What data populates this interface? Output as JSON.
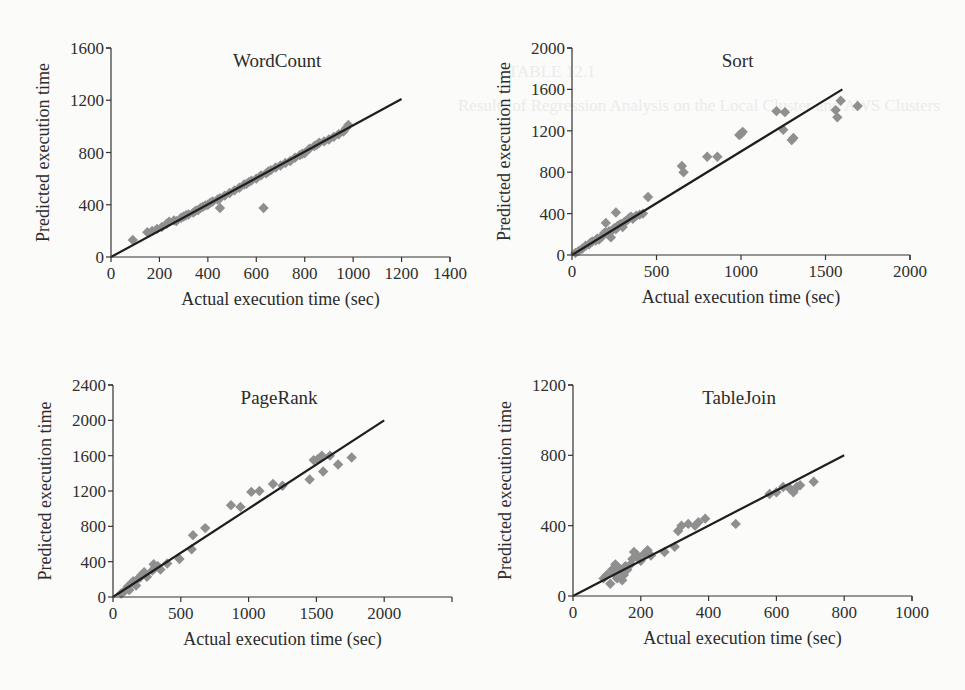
{
  "figure": {
    "background": "#fbfbfa",
    "marker_color": "#8f8f8f",
    "line_color": "#1e1e1e",
    "axis_color": "#333333"
  },
  "chart_data": [
    {
      "id": "wordcount",
      "type": "scatter",
      "title": "WordCount",
      "xlabel": "Actual execution time (sec)",
      "ylabel": "Predicted execution time",
      "xlim": [
        0,
        1400
      ],
      "ylim": [
        0,
        1600
      ],
      "xticks": [
        0,
        200,
        400,
        600,
        800,
        1000,
        1200,
        1400
      ],
      "yticks": [
        0,
        400,
        800,
        1200,
        1600
      ],
      "grid": false,
      "legend": null,
      "fit_line": {
        "x": [
          0,
          1200
        ],
        "y": [
          0,
          1210
        ]
      },
      "points": {
        "x": [
          90,
          150,
          170,
          190,
          210,
          230,
          240,
          260,
          270,
          290,
          300,
          310,
          320,
          340,
          350,
          360,
          370,
          380,
          390,
          400,
          410,
          420,
          440,
          450,
          470,
          490,
          510,
          530,
          550,
          560,
          570,
          580,
          600,
          620,
          640,
          650,
          660,
          680,
          700,
          720,
          740,
          760,
          780,
          790,
          800,
          820,
          840,
          850,
          860,
          880,
          900,
          920,
          940,
          960,
          970,
          980,
          630,
          450
        ],
        "y": [
          130,
          190,
          200,
          215,
          230,
          255,
          270,
          280,
          275,
          300,
          310,
          320,
          325,
          340,
          355,
          360,
          375,
          385,
          395,
          400,
          415,
          425,
          440,
          450,
          470,
          490,
          510,
          530,
          555,
          560,
          575,
          585,
          600,
          625,
          640,
          655,
          665,
          685,
          700,
          720,
          735,
          760,
          780,
          790,
          795,
          830,
          850,
          860,
          875,
          885,
          900,
          920,
          940,
          960,
          985,
          1010,
          375,
          375
        ]
      }
    },
    {
      "id": "sort",
      "type": "scatter",
      "title": "Sort",
      "xlabel": "Actual execution time (sec)",
      "ylabel": "Predicted execution time",
      "xlim": [
        0,
        2000
      ],
      "ylim": [
        0,
        2000
      ],
      "xticks": [
        0,
        500,
        1000,
        1500,
        2000
      ],
      "yticks": [
        0,
        400,
        800,
        1200,
        1600,
        2000
      ],
      "grid": false,
      "legend": null,
      "fit_line": {
        "x": [
          0,
          1600
        ],
        "y": [
          0,
          1600
        ]
      },
      "points": {
        "x": [
          20,
          40,
          60,
          80,
          100,
          110,
          120,
          140,
          150,
          160,
          180,
          190,
          200,
          220,
          230,
          240,
          250,
          260,
          270,
          280,
          290,
          300,
          310,
          320,
          330,
          340,
          350,
          360,
          380,
          400,
          420,
          450,
          650,
          660,
          800,
          860,
          990,
          1010,
          1000,
          1210,
          1260,
          1250,
          1300,
          1310,
          1560,
          1570,
          1590,
          1690,
          200,
          260
        ],
        "y": [
          20,
          40,
          60,
          90,
          100,
          120,
          130,
          140,
          160,
          150,
          180,
          210,
          220,
          230,
          170,
          240,
          260,
          250,
          280,
          290,
          300,
          270,
          320,
          330,
          340,
          360,
          370,
          350,
          380,
          390,
          400,
          560,
          860,
          800,
          950,
          950,
          1160,
          1190,
          1170,
          1390,
          1380,
          1210,
          1110,
          1130,
          1400,
          1330,
          1490,
          1440,
          310,
          410
        ]
      }
    },
    {
      "id": "pagerank",
      "type": "scatter",
      "title": "PageRank",
      "xlabel": "Actual execution time (sec)",
      "ylabel": "Predicted execution time",
      "xlim": [
        0,
        2500
      ],
      "ylim": [
        0,
        2400
      ],
      "xticks": [
        0,
        500,
        1000,
        1500,
        2000
      ],
      "yticks": [
        0,
        400,
        800,
        1200,
        1600,
        2000,
        2400
      ],
      "grid": false,
      "legend": null,
      "fit_line": {
        "x": [
          0,
          2000
        ],
        "y": [
          0,
          2000
        ]
      },
      "points": {
        "x": [
          60,
          80,
          100,
          110,
          120,
          140,
          150,
          170,
          180,
          200,
          210,
          230,
          250,
          290,
          300,
          310,
          330,
          350,
          400,
          490,
          580,
          590,
          680,
          870,
          940,
          1020,
          1080,
          1180,
          1250,
          1450,
          1480,
          1510,
          1540,
          1550,
          1600,
          1660,
          1760
        ],
        "y": [
          40,
          60,
          90,
          120,
          80,
          160,
          180,
          130,
          200,
          220,
          250,
          280,
          230,
          300,
          370,
          330,
          350,
          310,
          380,
          430,
          540,
          700,
          780,
          1040,
          1020,
          1190,
          1200,
          1280,
          1260,
          1330,
          1550,
          1560,
          1600,
          1420,
          1600,
          1500,
          1580
        ]
      }
    },
    {
      "id": "tablejoin",
      "type": "scatter",
      "title": "TableJoin",
      "xlabel": "Actual execution time (sec)",
      "ylabel": "Predicted execution time",
      "xlim": [
        0,
        1000
      ],
      "ylim": [
        0,
        1200
      ],
      "xticks": [
        0,
        200,
        400,
        600,
        800,
        1000
      ],
      "yticks": [
        0,
        400,
        800,
        1200
      ],
      "grid": false,
      "legend": null,
      "fit_line": {
        "x": [
          0,
          800
        ],
        "y": [
          0,
          800
        ]
      },
      "points": {
        "x": [
          90,
          100,
          110,
          115,
          120,
          125,
          130,
          135,
          140,
          145,
          150,
          155,
          160,
          170,
          175,
          180,
          190,
          200,
          210,
          220,
          230,
          270,
          300,
          310,
          320,
          340,
          360,
          370,
          390,
          480,
          580,
          600,
          620,
          640,
          650,
          660,
          670,
          710
        ],
        "y": [
          100,
          120,
          70,
          150,
          130,
          180,
          100,
          160,
          140,
          90,
          120,
          170,
          150,
          180,
          210,
          250,
          230,
          200,
          240,
          260,
          230,
          250,
          280,
          370,
          400,
          410,
          400,
          420,
          440,
          410,
          580,
          590,
          620,
          610,
          590,
          620,
          630,
          650
        ]
      }
    }
  ],
  "background_bleed_text": [
    "TABLE 12.1",
    "Results of Regression Analysis on the Local Cluster and AWS Clusters",
    "WordCount",
    "Sort",
    "PageRank",
    "TableJoin",
    "Local",
    "AWS"
  ]
}
